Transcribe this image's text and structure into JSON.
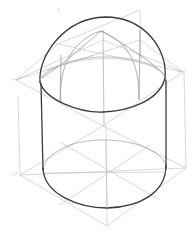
{
  "image": {
    "subject": "pencil construction sketch of a cylinder topped with a hemisphere",
    "colors": {
      "background": "#ffffff",
      "contour": "#3a3a3a",
      "construction": "#bdbdbd"
    }
  },
  "parts": [
    {
      "name": "hemisphere-dome",
      "label": "dome"
    },
    {
      "name": "cylinder-body",
      "label": "cylinder"
    },
    {
      "name": "bottom-ellipse",
      "label": "base ellipse"
    },
    {
      "name": "construction-box",
      "label": "construction lines"
    }
  ]
}
